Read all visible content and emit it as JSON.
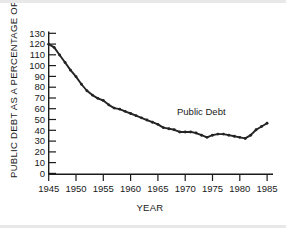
{
  "chart_data": {
    "type": "line",
    "title": "",
    "xlabel": "YEAR",
    "ylabel": "PUBLIC DEBT AS A PERCENTAGE OF GNP",
    "xlim": [
      1945,
      1986
    ],
    "ylim": [
      0,
      130
    ],
    "grid": false,
    "legend_position": "inline-annotation",
    "annotations": [
      {
        "text": "Public Debt",
        "x": 1971,
        "y": 58
      }
    ],
    "xticks": [
      1945,
      1950,
      1955,
      1960,
      1965,
      1970,
      1975,
      1980,
      1985
    ],
    "xtick_labels": [
      "1945",
      "1950",
      "1955",
      "1960",
      "1965",
      "1970",
      "1975",
      "1980",
      "1985"
    ],
    "yticks": [
      0,
      10,
      20,
      30,
      40,
      50,
      60,
      70,
      80,
      90,
      100,
      110,
      120,
      130
    ],
    "ytick_labels": [
      "0",
      "10",
      "20",
      "30",
      "40",
      "50",
      "60",
      "70",
      "80",
      "90",
      "100",
      "110",
      "120",
      "130"
    ],
    "series": [
      {
        "name": "Public Debt",
        "color": "#242424",
        "x": [
          1945,
          1946,
          1947,
          1948,
          1949,
          1950,
          1951,
          1952,
          1953,
          1954,
          1955,
          1956,
          1957,
          1958,
          1959,
          1960,
          1961,
          1962,
          1963,
          1964,
          1965,
          1966,
          1967,
          1968,
          1969,
          1970,
          1971,
          1972,
          1973,
          1974,
          1975,
          1976,
          1977,
          1978,
          1979,
          1980,
          1981,
          1982,
          1983,
          1984,
          1985
        ],
        "values": [
          120,
          117,
          110,
          103,
          96,
          90,
          83,
          77,
          73,
          70,
          68,
          64,
          61,
          60,
          58,
          56,
          54,
          52,
          50,
          48,
          46,
          43,
          42,
          41,
          39,
          39,
          39,
          38,
          36,
          34,
          36,
          37,
          37,
          36,
          35,
          34,
          33,
          36,
          41,
          44,
          47
        ]
      }
    ]
  }
}
